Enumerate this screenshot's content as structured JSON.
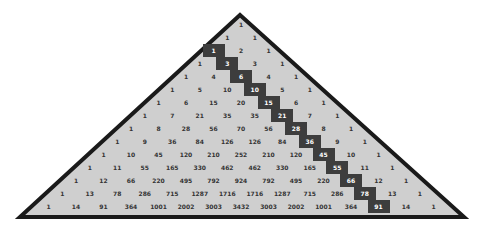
{
  "figure": {
    "fill_color": "#cfcfcf",
    "border_color": "#1a1a1a",
    "highlight_color": "#3d3d3d",
    "highlight_description": "Triangular numbers diagonal (C(n,2))"
  },
  "rows": [
    [
      "1"
    ],
    [
      "1",
      "1"
    ],
    [
      "1",
      "2",
      "1"
    ],
    [
      "1",
      "3",
      "3",
      "1"
    ],
    [
      "1",
      "4",
      "6",
      "4",
      "1"
    ],
    [
      "1",
      "5",
      "10",
      "10",
      "5",
      "1"
    ],
    [
      "1",
      "6",
      "15",
      "20",
      "15",
      "6",
      "1"
    ],
    [
      "1",
      "7",
      "21",
      "35",
      "35",
      "21",
      "7",
      "1"
    ],
    [
      "1",
      "8",
      "28",
      "56",
      "70",
      "56",
      "28",
      "8",
      "1"
    ],
    [
      "1",
      "9",
      "36",
      "84",
      "126",
      "126",
      "84",
      "36",
      "9",
      "1"
    ],
    [
      "1",
      "10",
      "45",
      "120",
      "210",
      "252",
      "210",
      "120",
      "45",
      "10",
      "1"
    ],
    [
      "1",
      "11",
      "55",
      "165",
      "330",
      "462",
      "462",
      "330",
      "165",
      "55",
      "11",
      "1"
    ],
    [
      "1",
      "12",
      "66",
      "220",
      "495",
      "792",
      "924",
      "792",
      "495",
      "220",
      "66",
      "12",
      "1"
    ],
    [
      "1",
      "13",
      "78",
      "286",
      "715",
      "1287",
      "1716",
      "1716",
      "1287",
      "715",
      "286",
      "78",
      "13",
      "1"
    ],
    [
      "1",
      "14",
      "91",
      "364",
      "1001",
      "2002",
      "3003",
      "3432",
      "3003",
      "2002",
      "1001",
      "364",
      "91",
      "14",
      "1"
    ]
  ],
  "highlighted": [
    [
      2,
      2
    ],
    [
      3,
      2
    ],
    [
      4,
      2
    ],
    [
      5,
      2
    ],
    [
      6,
      2
    ],
    [
      7,
      2
    ],
    [
      8,
      2
    ],
    [
      9,
      2
    ],
    [
      10,
      2
    ],
    [
      11,
      2
    ],
    [
      12,
      2
    ],
    [
      13,
      2
    ],
    [
      14,
      2
    ]
  ],
  "highlighted_values": [
    "1",
    "3",
    "6",
    "10",
    "15",
    "21",
    "28",
    "36",
    "45",
    "55",
    "66",
    "78",
    "91"
  ]
}
